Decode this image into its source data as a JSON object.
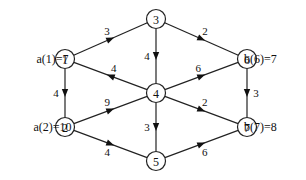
{
  "diagram": {
    "type": "directed-weighted-graph",
    "nodes": [
      {
        "id": "1",
        "label": "1",
        "x": 65,
        "y": 59,
        "annotation": "a(1)=7",
        "annotation_side": "left"
      },
      {
        "id": "2",
        "label": "2",
        "x": 65,
        "y": 127,
        "annotation": "a(2)=10",
        "annotation_side": "left"
      },
      {
        "id": "3",
        "label": "3",
        "x": 156,
        "y": 19,
        "annotation": "",
        "annotation_side": ""
      },
      {
        "id": "4",
        "label": "4",
        "x": 156,
        "y": 93,
        "annotation": "",
        "annotation_side": ""
      },
      {
        "id": "5",
        "label": "5",
        "x": 156,
        "y": 161,
        "annotation": "",
        "annotation_side": ""
      },
      {
        "id": "6",
        "label": "6",
        "x": 247,
        "y": 59,
        "annotation": "b(6)=7",
        "annotation_side": "right"
      },
      {
        "id": "7",
        "label": "7",
        "x": 247,
        "y": 127,
        "annotation": "b(7)=8",
        "annotation_side": "right"
      }
    ],
    "edges": [
      {
        "from": "1",
        "to": "3",
        "weight": "3"
      },
      {
        "from": "1",
        "to": "2",
        "weight": "4"
      },
      {
        "from": "4",
        "to": "1",
        "weight": "4"
      },
      {
        "from": "3",
        "to": "4",
        "weight": "4"
      },
      {
        "from": "3",
        "to": "6",
        "weight": "2"
      },
      {
        "from": "4",
        "to": "6",
        "weight": "6"
      },
      {
        "from": "4",
        "to": "7",
        "weight": "2"
      },
      {
        "from": "4",
        "to": "5",
        "weight": "3"
      },
      {
        "from": "2",
        "to": "4",
        "weight": "9"
      },
      {
        "from": "2",
        "to": "5",
        "weight": "4"
      },
      {
        "from": "6",
        "to": "7",
        "weight": "3"
      },
      {
        "from": "5",
        "to": "7",
        "weight": "6"
      }
    ]
  }
}
